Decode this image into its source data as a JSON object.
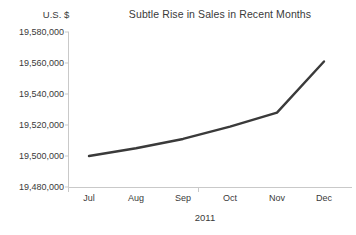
{
  "chart_data": {
    "type": "line",
    "title": "Subtle Rise in Sales in Recent Months",
    "xlabel": "2011",
    "ylabel": "U.S. $",
    "categories": [
      "Jul",
      "Aug",
      "Sep",
      "Oct",
      "Nov",
      "Dec"
    ],
    "values": [
      19500000,
      19505000,
      19511000,
      19519000,
      19528000,
      19561000
    ],
    "series": [
      {
        "name": "Sales",
        "values": [
          19500000,
          19505000,
          19511000,
          19519000,
          19528000,
          19561000
        ]
      }
    ],
    "ylim": [
      19480000,
      19580000
    ],
    "ytick_step": 20000,
    "ytick_labels": [
      "19,580,000",
      "19,560,000",
      "19,540,000",
      "19,520,000",
      "19,500,000",
      "19,480,000"
    ],
    "ytick_values": [
      19580000,
      19560000,
      19540000,
      19520000,
      19500000,
      19480000
    ],
    "grid": false,
    "legend": false,
    "legend_position": "none",
    "markers": false,
    "colors": {
      "series_line": "#3a3a3a",
      "axis": "#c9c9c9",
      "text": "#3a3a3a",
      "background": "#ffffff"
    }
  }
}
